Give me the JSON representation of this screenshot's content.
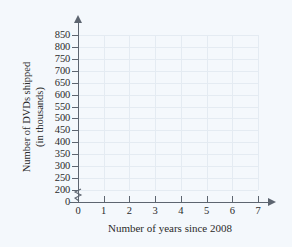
{
  "chart_data": {
    "type": "scatter",
    "title": "",
    "subtitle": "",
    "xlabel": "Number of years since 2008",
    "ylabel_line1": "Number of DVDs shipped",
    "ylabel_line2": "(in thousands)",
    "x": [],
    "values": [],
    "series": [],
    "xticks": [
      "0",
      "1",
      "2",
      "3",
      "4",
      "5",
      "6",
      "7"
    ],
    "xtick_values": [
      0,
      1,
      2,
      3,
      4,
      5,
      6,
      7
    ],
    "yticks": [
      "0",
      "200",
      "250",
      "300",
      "350",
      "400",
      "450",
      "500",
      "550",
      "600",
      "650",
      "700",
      "750",
      "800",
      "850"
    ],
    "ytick_values": [
      0,
      200,
      250,
      300,
      350,
      400,
      450,
      500,
      550,
      600,
      650,
      700,
      750,
      800,
      850
    ],
    "xlim": [
      0,
      7
    ],
    "ylim": [
      200,
      850
    ],
    "y_axis_break": true,
    "y_axis_break_between": [
      0,
      200
    ],
    "grid": true,
    "grid_color": "#e4ebf2",
    "axis_color": "#5d6570",
    "background_color": "#f4f8fc",
    "legend": [],
    "legend_position": "none",
    "annotations": []
  }
}
